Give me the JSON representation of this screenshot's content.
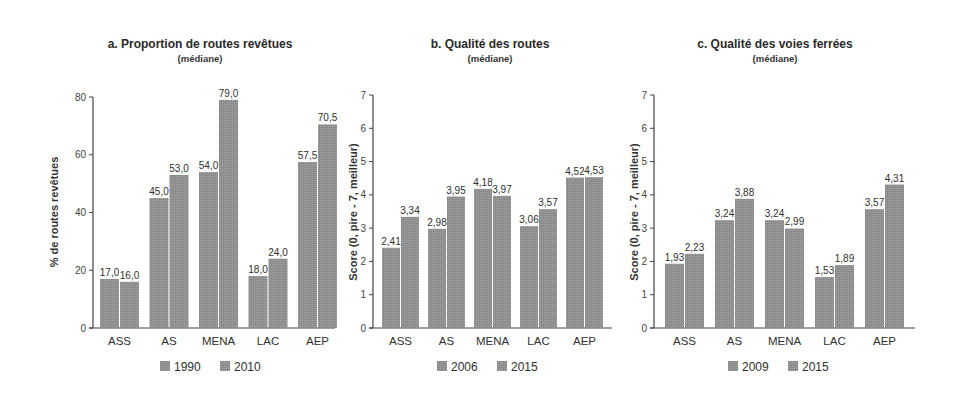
{
  "colors": {
    "bar": "#8f8f8f",
    "bar_edge": "#f4f4f4",
    "axis": "#444444",
    "background": "#ffffff"
  },
  "chart_data": [
    {
      "type": "bar",
      "title": "a. Proportion de routes revêtues",
      "subtitle": "(médiane)",
      "xlabel": "",
      "ylabel": "% de routes revêtues",
      "ylim": [
        0,
        80
      ],
      "yticks": [
        0,
        20,
        40,
        60,
        80
      ],
      "categories": [
        "ASS",
        "AS",
        "MENA",
        "LAC",
        "AEP"
      ],
      "series": [
        {
          "name": "1990",
          "values": [
            17.0,
            45.0,
            54.0,
            18.0,
            57.5
          ],
          "labels": [
            "17,0",
            "45,0",
            "54,0",
            "18,0",
            "57,5"
          ]
        },
        {
          "name": "2010",
          "values": [
            16.0,
            53.0,
            79.0,
            24.0,
            70.5
          ],
          "labels": [
            "16,0",
            "53,0",
            "79,0",
            "24,0",
            "70,5"
          ]
        }
      ],
      "legend_position": "bottom",
      "grid": false
    },
    {
      "type": "bar",
      "title": "b. Qualité des routes",
      "subtitle": "(médiane)",
      "xlabel": "",
      "ylabel": "Score (0, pire - 7, meilleur)",
      "ylim": [
        0,
        7
      ],
      "yticks": [
        0,
        1,
        2,
        3,
        4,
        5,
        6,
        7
      ],
      "categories": [
        "ASS",
        "AS",
        "MENA",
        "LAC",
        "AEP"
      ],
      "series": [
        {
          "name": "2006",
          "values": [
            2.41,
            2.98,
            4.18,
            3.06,
            4.52
          ],
          "labels": [
            "2,41",
            "2,98",
            "4,18",
            "3,06",
            "4,52"
          ]
        },
        {
          "name": "2015",
          "values": [
            3.34,
            3.95,
            3.97,
            3.57,
            4.53
          ],
          "labels": [
            "3,34",
            "3,95",
            "3,97",
            "3,57",
            "4,53"
          ]
        }
      ],
      "legend_position": "bottom",
      "grid": false
    },
    {
      "type": "bar",
      "title": "c. Qualité des voies ferrées",
      "subtitle": "(médiane)",
      "xlabel": "",
      "ylabel": "Score (0, pire - 7, meilleur)",
      "ylim": [
        0,
        7
      ],
      "yticks": [
        0,
        1,
        2,
        3,
        4,
        5,
        6,
        7
      ],
      "categories": [
        "ASS",
        "AS",
        "MENA",
        "LAC",
        "AEP"
      ],
      "series": [
        {
          "name": "2009",
          "values": [
            1.93,
            3.24,
            3.24,
            1.53,
            3.57
          ],
          "labels": [
            "1,93",
            "3,24",
            "3,24",
            "1,53",
            "3,57"
          ]
        },
        {
          "name": "2015",
          "values": [
            2.23,
            3.88,
            2.99,
            1.89,
            4.31
          ],
          "labels": [
            "2,23",
            "3,88",
            "2,99",
            "1,89",
            "4,31"
          ]
        }
      ],
      "legend_position": "bottom",
      "grid": false
    }
  ],
  "layout": {
    "panels": [
      {
        "axis_x": 93,
        "plot_right": 335,
        "y_top": 97,
        "y_bottom": 328,
        "title_cx": 200,
        "group_start": 100,
        "group_step": 49.5,
        "bar_w": 19,
        "ylabel_x": 58,
        "legend_x": 160
      },
      {
        "axis_x": 373,
        "plot_right": 612,
        "y_top": 95,
        "y_bottom": 328,
        "title_cx": 490,
        "group_start": 382,
        "group_step": 46,
        "bar_w": 18,
        "ylabel_x": 356,
        "legend_x": 437
      },
      {
        "axis_x": 654,
        "plot_right": 915,
        "y_top": 95,
        "y_bottom": 328,
        "title_cx": 775,
        "group_start": 665,
        "group_step": 50,
        "bar_w": 19,
        "ylabel_x": 637,
        "legend_x": 728
      }
    ]
  }
}
